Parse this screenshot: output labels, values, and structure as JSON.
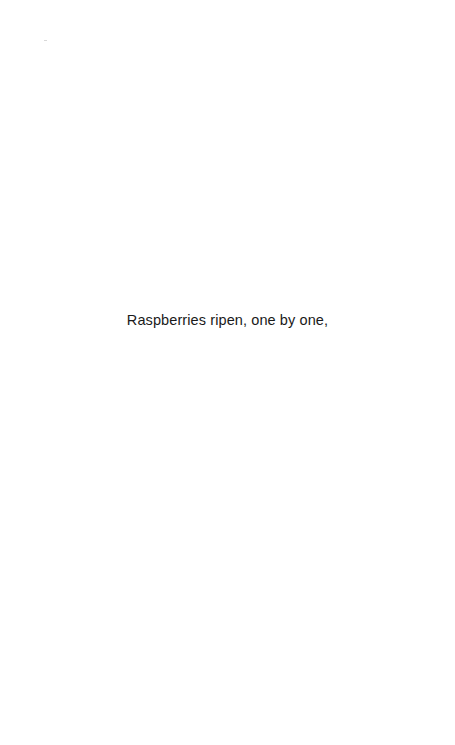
{
  "page": {
    "background": "#ffffff",
    "header_mark": "",
    "lines": [
      "Raspberries ripen, one by one,"
    ]
  }
}
